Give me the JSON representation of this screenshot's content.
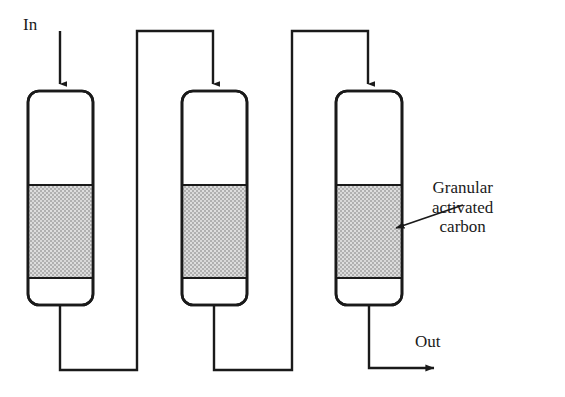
{
  "figure": {
    "type": "process-flow-diagram",
    "background_color": "#ffffff",
    "line_color": "#1a1a1a",
    "bed_fill_color": "#b3b3b3",
    "vessel_fill_color": "#ffffff"
  },
  "labels": {
    "inlet": "In",
    "outlet": "Out",
    "callout_lines": [
      "Granular",
      "activated",
      "carbon"
    ],
    "callout_text": "Granular activated carbon"
  },
  "columns": [
    {
      "id": "column-1",
      "order": 1,
      "x": 28,
      "y": 91,
      "width": 65,
      "height": 214,
      "corner_radius": 11,
      "bed_top": 185,
      "bed_bottom": 278,
      "center_x": 60
    },
    {
      "id": "column-2",
      "order": 2,
      "x": 182,
      "y": 91,
      "width": 65,
      "height": 214,
      "corner_radius": 11,
      "bed_top": 185,
      "bed_bottom": 278,
      "center_x": 214
    },
    {
      "id": "column-3",
      "order": 3,
      "x": 336,
      "y": 91,
      "width": 66,
      "height": 214,
      "corner_radius": 11,
      "bed_top": 185,
      "bed_bottom": 278,
      "center_x": 369
    }
  ],
  "piping": {
    "inlet_arrow": "M60,31 L60,86",
    "outlet_1_to_riser": "M60,305 L60,370 L137,370 L137,31 L213,31 L213,86",
    "outlet_2_to_riser": "M214,305 L214,370 L292,370 L292,31 L368,31 L368,86",
    "final_outlet": "M369,305 L369,368 L437,368",
    "callout_leader": "M463,205 L392,229"
  },
  "stroke_widths": {
    "vessel": 2.6,
    "pipe": 2.4,
    "bed_boundary": 2.2,
    "leader": 1.8
  }
}
